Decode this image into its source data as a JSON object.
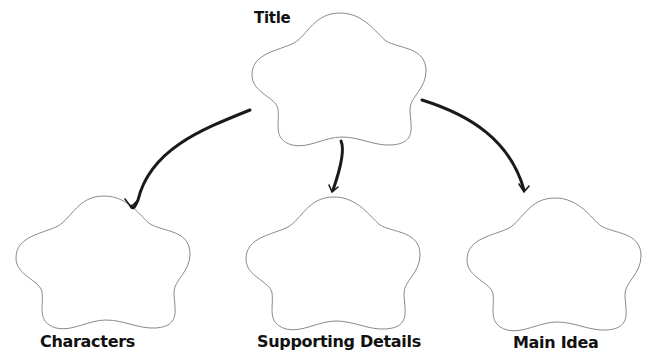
{
  "diagram": {
    "type": "graphic-organizer",
    "nodes": [
      {
        "id": "title",
        "label": "Title",
        "shape": "cloud-blob"
      },
      {
        "id": "characters",
        "label": "Characters",
        "shape": "cloud-blob"
      },
      {
        "id": "supporting",
        "label": "Supporting Details",
        "shape": "cloud-blob"
      },
      {
        "id": "main",
        "label": "Main Idea",
        "shape": "cloud-blob"
      }
    ],
    "edges": [
      {
        "from": "title",
        "to": "characters"
      },
      {
        "from": "title",
        "to": "supporting"
      },
      {
        "from": "title",
        "to": "main"
      }
    ],
    "colors": {
      "outline": "#8a8a8a",
      "arrow": "#1a1a1a",
      "text": "#111111",
      "background": "#ffffff"
    }
  }
}
